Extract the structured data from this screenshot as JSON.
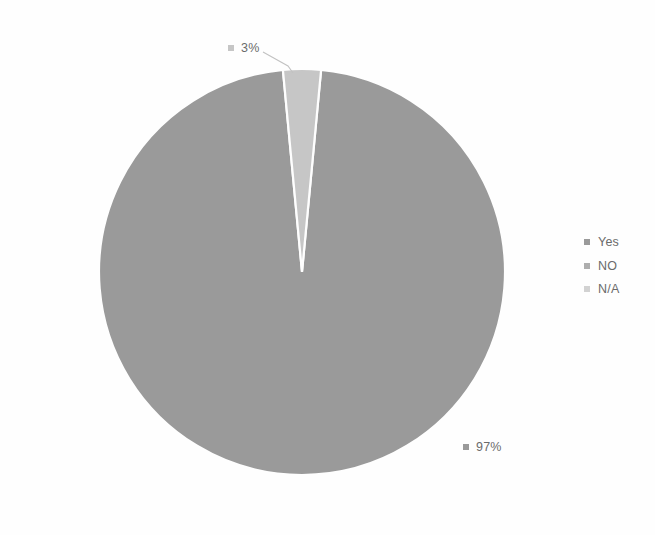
{
  "chart_data": {
    "type": "pie",
    "title": "",
    "categories": [
      "Yes",
      "NO",
      "N/A"
    ],
    "values": [
      97,
      3,
      0
    ],
    "value_labels": [
      "97%",
      "3%",
      ""
    ],
    "units": "percent",
    "legend_position": "right",
    "grid": false,
    "colors": [
      "#9a9a9a",
      "#c6c6c6",
      "#d8d8d8"
    ],
    "background": "#fefefe",
    "slices": [
      {
        "name": "Yes",
        "value": 97,
        "label": "97%",
        "color": "#9a9a9a",
        "start_angle_deg": -84.6,
        "sweep_deg": 349.2
      },
      {
        "name": "NO",
        "value": 3,
        "label": "3%",
        "color": "#c6c6c6",
        "start_angle_deg": -95.4,
        "sweep_deg": 10.8
      },
      {
        "name": "N/A",
        "value": 0,
        "label": "",
        "color": "#d8d8d8",
        "start_angle_deg": -95.4,
        "sweep_deg": 0
      }
    ],
    "geometry": {
      "center_x": 302,
      "center_y": 272,
      "radius": 203
    }
  },
  "labels": {
    "small_slice": {
      "text": "3%",
      "color": "#c6c6c6"
    },
    "large_slice": {
      "text": "97%",
      "color": "#9a9a9a"
    }
  },
  "legend": {
    "items": [
      {
        "label": "Yes",
        "color": "#9a9a9a"
      },
      {
        "label": "NO",
        "color": "#aeaeae"
      },
      {
        "label": "N/A",
        "color": "#d2d2d2"
      }
    ]
  }
}
